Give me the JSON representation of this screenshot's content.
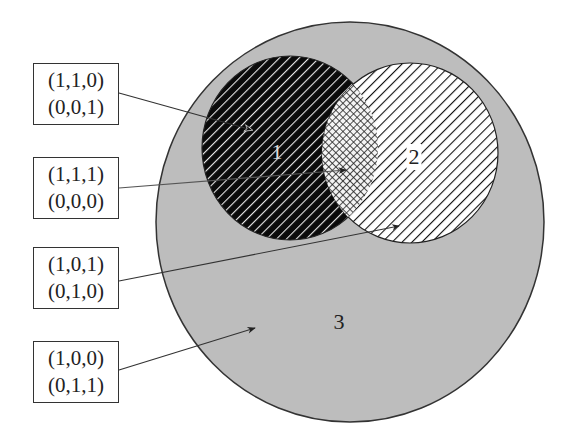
{
  "diagram": {
    "type": "venn",
    "colors": {
      "universe_fill": "#bdbdbd",
      "circle1_fill": "#0a0a0a",
      "circle1_hatch": "#e8e8e8",
      "circle2_fill": "#ffffff",
      "circle2_hatch": "#111111",
      "outline": "#333333"
    },
    "regions": [
      {
        "id": "1",
        "label": "1"
      },
      {
        "id": "2",
        "label": "2"
      },
      {
        "id": "3",
        "label": "3"
      }
    ],
    "callouts": [
      {
        "line1": "(1,1,0)",
        "line2": "(0,0,1)",
        "points_to": "region 1 only"
      },
      {
        "line1": "(1,1,1)",
        "line2": "(0,0,0)",
        "points_to": "intersection of 1 and 2"
      },
      {
        "line1": "(1,0,1)",
        "line2": "(0,1,0)",
        "points_to": "region 2 only"
      },
      {
        "line1": "(1,0,0)",
        "line2": "(0,1,1)",
        "points_to": "region 3"
      }
    ]
  }
}
